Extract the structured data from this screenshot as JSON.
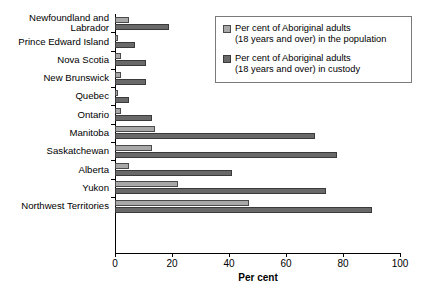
{
  "chart_data": {
    "type": "bar",
    "orientation": "horizontal",
    "title": "",
    "xlabel": "Per cent",
    "ylabel": "",
    "xlim": [
      0,
      100
    ],
    "xticks": [
      0,
      20,
      40,
      60,
      80,
      100
    ],
    "grid": false,
    "legend_position": "top-right",
    "categories": [
      "Newfoundland and\nLabrador",
      "Prince Edward Island",
      "Nova Scotia",
      "New Brunswick",
      "Quebec",
      "Ontario",
      "Manitoba",
      "Saskatchewan",
      "Alberta",
      "Yukon",
      "Northwest Territories"
    ],
    "series": [
      {
        "name": "Per cent of Aboriginal adults\n(18 years and over) in the population",
        "color": "#a8a8a8",
        "values": [
          5,
          1,
          2,
          2,
          1,
          2,
          14,
          13,
          5,
          22,
          47
        ]
      },
      {
        "name": "Per cent of Aboriginal adults\n(18 years and over) in custody",
        "color": "#696969",
        "values": [
          19,
          7,
          11,
          11,
          5,
          13,
          70,
          78,
          41,
          74,
          90
        ]
      }
    ]
  },
  "legend": {
    "items": [
      {
        "label": "Per cent of Aboriginal adults\n(18 years and over) in the population",
        "swatch": "light-gray-swatch"
      },
      {
        "label": "Per cent of Aboriginal adults\n(18 years and over) in custody",
        "swatch": "dark-gray-swatch"
      }
    ]
  },
  "axis": {
    "x_title": "Per cent",
    "x_tick_labels": [
      "0",
      "20",
      "40",
      "60",
      "80",
      "100"
    ]
  }
}
